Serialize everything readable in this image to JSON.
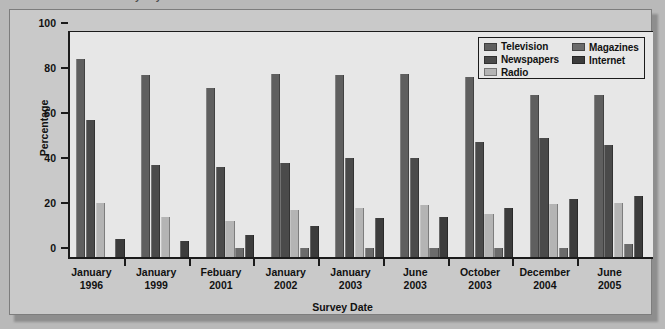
{
  "caption": "Use of media every day",
  "chart_data": {
    "type": "bar",
    "title": "",
    "xlabel": "Survey Date",
    "ylabel": "Percentage",
    "ylim": [
      0,
      100
    ],
    "yticks": [
      0,
      20,
      40,
      60,
      80,
      100
    ],
    "grid": false,
    "legend_position": "top-right",
    "categories": [
      "January\n1996",
      "January\n1999",
      "Febuary\n2001",
      "January\n2002",
      "January\n2003",
      "June\n2003",
      "October\n2003",
      "December\n2004",
      "June\n2005"
    ],
    "category_lines": [
      [
        "January",
        "1996"
      ],
      [
        "January",
        "1999"
      ],
      [
        "Febuary",
        "2001"
      ],
      [
        "January",
        "2002"
      ],
      [
        "January",
        "2003"
      ],
      [
        "June",
        "2003"
      ],
      [
        "October",
        "2003"
      ],
      [
        "December",
        "2004"
      ],
      [
        "June",
        "2005"
      ]
    ],
    "series": [
      {
        "name": "Television",
        "color": "#5f5f5f",
        "values": [
          88,
          81,
          75,
          81.5,
          81,
          81.5,
          80,
          72,
          72
        ]
      },
      {
        "name": "Newspapers",
        "color": "#4a4a4a",
        "values": [
          61,
          41,
          40,
          42,
          44,
          44,
          51,
          53,
          50
        ]
      },
      {
        "name": "Radio",
        "color": "#b4b4b4",
        "values": [
          24,
          18,
          16,
          21,
          22,
          23,
          19,
          23.5,
          24
        ]
      },
      {
        "name": "Magazines",
        "color": "#6b6b6b",
        "values": [
          0,
          0,
          4,
          4,
          4,
          4,
          4,
          4,
          6
        ]
      },
      {
        "name": "Internet",
        "color": "#3c3c3c",
        "values": [
          8,
          7,
          10,
          14,
          17.5,
          18,
          22,
          26,
          27
        ]
      }
    ]
  },
  "legend": {
    "columns": [
      [
        "Television",
        "Newspapers",
        "Radio"
      ],
      [
        "Magazines",
        "Internet"
      ]
    ]
  },
  "colors": {
    "page_background": "#b9b9b9",
    "frame_background": "#c9c9c9",
    "plot_background": "#e7e7e7",
    "axis": "#1b1b1b"
  }
}
